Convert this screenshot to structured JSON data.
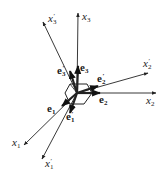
{
  "diagram": {
    "type": "coordinate-rotation",
    "origin": [
      77,
      93
    ],
    "axes": [
      {
        "id": "x1",
        "label": "x",
        "sub": "1",
        "prime": false,
        "end": [
          24,
          145
        ],
        "label_pos": [
          12,
          146
        ]
      },
      {
        "id": "x2",
        "label": "x",
        "sub": "2",
        "prime": false,
        "end": [
          156,
          93
        ],
        "label_pos": [
          146,
          104
        ]
      },
      {
        "id": "x3",
        "label": "x",
        "sub": "3",
        "prime": false,
        "end": [
          78,
          13
        ],
        "label_pos": [
          82,
          20
        ]
      },
      {
        "id": "x1p",
        "label": "x",
        "sub": "1",
        "prime": true,
        "end": [
          42,
          159
        ],
        "label_pos": [
          45,
          167
        ]
      },
      {
        "id": "x2p",
        "label": "x",
        "sub": "2",
        "prime": true,
        "end": [
          148,
          73
        ],
        "label_pos": [
          143,
          67
        ]
      },
      {
        "id": "x3p",
        "label": "x",
        "sub": "3",
        "prime": true,
        "end": [
          43,
          22
        ],
        "label_pos": [
          48,
          22
        ]
      }
    ],
    "basis_vectors": [
      {
        "id": "e1",
        "label": "e",
        "sub": "1",
        "prime": false,
        "end": [
          62,
          106
        ],
        "label_pos": [
          47,
          112
        ]
      },
      {
        "id": "e2",
        "label": "e",
        "sub": "2",
        "prime": false,
        "end": [
          100,
          93
        ],
        "label_pos": [
          99,
          103
        ]
      },
      {
        "id": "e3",
        "label": "e",
        "sub": "3",
        "prime": false,
        "end": [
          78,
          66
        ],
        "label_pos": [
          80,
          71
        ]
      },
      {
        "id": "e1p",
        "label": "e",
        "sub": "1",
        "prime": true,
        "end": [
          70,
          113
        ],
        "label_pos": [
          66,
          120
        ]
      },
      {
        "id": "e2p",
        "label": "e",
        "sub": "2",
        "prime": true,
        "end": [
          98,
          86
        ],
        "label_pos": [
          97,
          82
        ]
      },
      {
        "id": "e3p",
        "label": "e",
        "sub": "3",
        "prime": true,
        "end": [
          70,
          71
        ],
        "label_pos": [
          57,
          74
        ]
      }
    ],
    "prime_mark": "′",
    "stroke_color": "#222222"
  }
}
